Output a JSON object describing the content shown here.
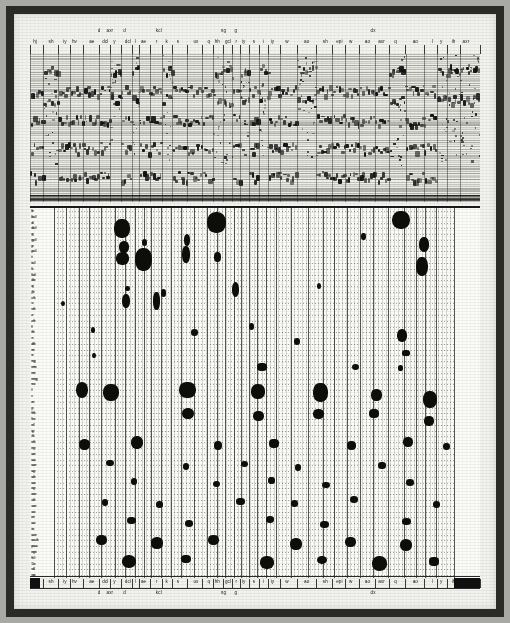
{
  "figure": {
    "type": "speech-spectrogram-with-phonetic-lattice",
    "colors": {
      "paper": "#f2f2ee",
      "ink": "#0d0d0b",
      "frame": "#2a2a28",
      "grid": "#5a5a58"
    }
  },
  "top_labels": {
    "main_row": [
      {
        "text": "hj",
        "x": 1.8
      },
      {
        "text": "sh",
        "x": 7.5
      },
      {
        "text": "iy",
        "x": 12.4
      },
      {
        "text": "hv",
        "x": 15.8
      },
      {
        "text": "ae",
        "x": 22.0
      },
      {
        "text": "dcl",
        "x": 26.8
      },
      {
        "text": "y",
        "x": 30.0
      },
      {
        "text": "dcl",
        "x": 34.8
      },
      {
        "text": "l",
        "x": 37.4
      },
      {
        "text": "ae",
        "x": 40.4
      },
      {
        "text": "r",
        "x": 45.0
      },
      {
        "text": "k",
        "x": 48.6
      },
      {
        "text": "s",
        "x": 52.6
      },
      {
        "text": "ux",
        "x": 59.0
      },
      {
        "text": "q",
        "x": 63.6
      },
      {
        "text": "hh",
        "x": 66.6
      },
      {
        "text": "gcl",
        "x": 70.4
      },
      {
        "text": "r",
        "x": 73.4
      },
      {
        "text": "iy",
        "x": 76.0
      },
      {
        "text": "s",
        "x": 79.6
      },
      {
        "text": "i",
        "x": 83.0
      },
      {
        "text": "iy",
        "x": 86.2
      },
      {
        "text": "w",
        "x": 91.4
      },
      {
        "text": "ao",
        "x": 98.4
      },
      {
        "text": "sh",
        "x": 105.0
      },
      {
        "text": "epi",
        "x": 110.0
      },
      {
        "text": "w",
        "x": 114.0
      },
      {
        "text": "ao",
        "x": 120.0
      },
      {
        "text": "axr",
        "x": 125.0
      },
      {
        "text": "q",
        "x": 130.0
      },
      {
        "text": "ao",
        "x": 137.0
      },
      {
        "text": "l",
        "x": 143.0
      },
      {
        "text": "y",
        "x": 146.2
      },
      {
        "text": "ih",
        "x": 150.6
      },
      {
        "text": "axr",
        "x": 155.0
      }
    ],
    "sub_row": [
      {
        "text": "d",
        "x": 24.6
      },
      {
        "text": "axr",
        "x": 28.4
      },
      {
        "text": "d",
        "x": 33.6
      },
      {
        "text": "kcl",
        "x": 45.8
      },
      {
        "text": "ng",
        "x": 68.8
      },
      {
        "text": "g",
        "x": 73.2
      },
      {
        "text": "dx",
        "x": 122.0
      }
    ]
  },
  "bottom_labels": {
    "main_row": [
      {
        "text": "hj",
        "x": 1.8
      },
      {
        "text": "sh",
        "x": 7.5
      },
      {
        "text": "iy",
        "x": 12.4
      },
      {
        "text": "hv",
        "x": 15.8
      },
      {
        "text": "ae",
        "x": 22.0
      },
      {
        "text": "dcl",
        "x": 26.8
      },
      {
        "text": "y",
        "x": 30.0
      },
      {
        "text": "dcl",
        "x": 34.8
      },
      {
        "text": "l",
        "x": 37.4
      },
      {
        "text": "ae",
        "x": 40.4
      },
      {
        "text": "r",
        "x": 45.0
      },
      {
        "text": "k",
        "x": 48.6
      },
      {
        "text": "s",
        "x": 52.6
      },
      {
        "text": "ux",
        "x": 59.0
      },
      {
        "text": "q",
        "x": 63.6
      },
      {
        "text": "hh",
        "x": 66.6
      },
      {
        "text": "gcl",
        "x": 70.4
      },
      {
        "text": "r",
        "x": 73.4
      },
      {
        "text": "iy",
        "x": 76.0
      },
      {
        "text": "s",
        "x": 79.6
      },
      {
        "text": "i",
        "x": 83.0
      },
      {
        "text": "iy",
        "x": 86.2
      },
      {
        "text": "w",
        "x": 91.4
      },
      {
        "text": "ao",
        "x": 98.4
      },
      {
        "text": "sh",
        "x": 105.0
      },
      {
        "text": "epi",
        "x": 110.0
      },
      {
        "text": "w",
        "x": 114.0
      },
      {
        "text": "ao",
        "x": 120.0
      },
      {
        "text": "axr",
        "x": 125.0
      },
      {
        "text": "q",
        "x": 130.0
      },
      {
        "text": "ao",
        "x": 137.0
      },
      {
        "text": "l",
        "x": 143.0
      },
      {
        "text": "y",
        "x": 146.2
      },
      {
        "text": "ih",
        "x": 150.6
      },
      {
        "text": "axr",
        "x": 155.0
      }
    ],
    "sub_row": [
      {
        "text": "d",
        "x": 24.6
      },
      {
        "text": "axr",
        "x": 28.4
      },
      {
        "text": "d",
        "x": 33.6
      },
      {
        "text": "kcl",
        "x": 45.8
      },
      {
        "text": "ng",
        "x": 68.8
      },
      {
        "text": "g",
        "x": 73.2
      },
      {
        "text": "dx",
        "x": 122.0
      }
    ]
  },
  "axis_labels": {
    "left": [
      "b",
      "bcl",
      "d",
      "dcl",
      "g",
      "gcl",
      "p",
      "pcl",
      "t",
      "tcl",
      "k",
      "kcl",
      "dx",
      "q",
      "jh",
      "ch",
      "s",
      "sh",
      "z",
      "zh",
      "f",
      "th",
      "v",
      "dh",
      "m",
      "n",
      "ng",
      "em",
      "en",
      "eng",
      "nx",
      "l",
      "r",
      "w",
      "y",
      "hh",
      "hv",
      "el",
      "iy",
      "ih",
      "eh",
      "ey",
      "ae",
      "aa",
      "aw",
      "ay",
      "ah",
      "ao",
      "oy",
      "ow",
      "uh",
      "uw",
      "ux",
      "er",
      "ax",
      "ix",
      "axr",
      "ax-h",
      "pau",
      "epi",
      "h#",
      "1x",
      "sil",
      "sp"
    ],
    "right": [
      "b",
      "bcl",
      "d",
      "dcl",
      "g",
      "gcl",
      "p",
      "pcl",
      "t",
      "tcl",
      "k",
      "kcl",
      "dx",
      "q",
      "jh",
      "ch",
      "s",
      "sh",
      "z",
      "zh",
      "f",
      "th",
      "v",
      "dh",
      "m",
      "n",
      "ng",
      "em",
      "en",
      "eng",
      "nx",
      "l",
      "r",
      "w",
      "y",
      "hh",
      "hv",
      "el",
      "iy",
      "ih",
      "eh",
      "ey",
      "ae",
      "aa",
      "aw",
      "ay",
      "ah",
      "ao",
      "oy",
      "ow",
      "uh",
      "uw",
      "ux",
      "er",
      "ax",
      "ix",
      "axr",
      "ax-h",
      "pau",
      "epi",
      "h#",
      "1x",
      "sil",
      "sp"
    ]
  },
  "chart_data": {
    "type": "heatmap",
    "title": "",
    "xlabel": "",
    "ylabel": "",
    "grid": true,
    "legend": "none",
    "blobs": [
      {
        "x": 17.0,
        "y": 3.0,
        "w": 3.4,
        "h": 2.6
      },
      {
        "x": 40.6,
        "y": 2.0,
        "w": 4.2,
        "h": 3.0
      },
      {
        "x": 86.8,
        "y": 1.6,
        "w": 4.0,
        "h": 2.6
      },
      {
        "x": 17.6,
        "y": 6.2,
        "w": 2.2,
        "h": 1.6
      },
      {
        "x": 22.6,
        "y": 5.4,
        "w": 1.2,
        "h": 1.0
      },
      {
        "x": 33.2,
        "y": 5.0,
        "w": 1.4,
        "h": 1.6
      },
      {
        "x": 77.4,
        "y": 4.4,
        "w": 1.0,
        "h": 1.0
      },
      {
        "x": 92.6,
        "y": 5.8,
        "w": 2.2,
        "h": 2.0
      },
      {
        "x": 17.2,
        "y": 8.2,
        "w": 2.8,
        "h": 1.8
      },
      {
        "x": 22.4,
        "y": 8.4,
        "w": 3.6,
        "h": 3.2
      },
      {
        "x": 33.0,
        "y": 7.6,
        "w": 1.6,
        "h": 2.4
      },
      {
        "x": 40.8,
        "y": 8.0,
        "w": 1.6,
        "h": 1.4
      },
      {
        "x": 92.0,
        "y": 9.6,
        "w": 2.6,
        "h": 2.6
      },
      {
        "x": 18.4,
        "y": 13.4,
        "w": 1.0,
        "h": 0.8
      },
      {
        "x": 27.4,
        "y": 14.2,
        "w": 1.2,
        "h": 1.0
      },
      {
        "x": 45.4,
        "y": 13.6,
        "w": 1.6,
        "h": 2.0
      },
      {
        "x": 66.2,
        "y": 13.0,
        "w": 1.0,
        "h": 0.8
      },
      {
        "x": 18.0,
        "y": 15.6,
        "w": 1.6,
        "h": 2.0
      },
      {
        "x": 25.6,
        "y": 15.6,
        "w": 1.4,
        "h": 2.4
      },
      {
        "x": 2.2,
        "y": 16.0,
        "w": 1.0,
        "h": 0.8
      },
      {
        "x": 9.8,
        "y": 20.6,
        "w": 0.8,
        "h": 0.8
      },
      {
        "x": 10.0,
        "y": 25.0,
        "w": 0.8,
        "h": 0.8
      },
      {
        "x": 35.2,
        "y": 21.0,
        "w": 1.6,
        "h": 1.0
      },
      {
        "x": 49.4,
        "y": 20.0,
        "w": 1.2,
        "h": 1.0
      },
      {
        "x": 60.8,
        "y": 22.6,
        "w": 1.4,
        "h": 1.0
      },
      {
        "x": 87.0,
        "y": 21.6,
        "w": 2.2,
        "h": 1.8
      },
      {
        "x": 88.0,
        "y": 24.6,
        "w": 1.6,
        "h": 0.8
      },
      {
        "x": 52.0,
        "y": 27.0,
        "w": 2.0,
        "h": 1.0
      },
      {
        "x": 75.4,
        "y": 27.0,
        "w": 1.6,
        "h": 0.9
      },
      {
        "x": 86.6,
        "y": 27.2,
        "w": 1.2,
        "h": 0.8
      },
      {
        "x": 7.0,
        "y": 31.0,
        "w": 2.8,
        "h": 2.2
      },
      {
        "x": 14.2,
        "y": 31.4,
        "w": 3.4,
        "h": 2.4
      },
      {
        "x": 33.4,
        "y": 31.0,
        "w": 3.6,
        "h": 2.2
      },
      {
        "x": 51.0,
        "y": 31.2,
        "w": 3.0,
        "h": 2.0
      },
      {
        "x": 66.6,
        "y": 31.4,
        "w": 3.2,
        "h": 2.6
      },
      {
        "x": 80.6,
        "y": 31.8,
        "w": 2.4,
        "h": 1.6
      },
      {
        "x": 94.0,
        "y": 32.6,
        "w": 3.0,
        "h": 2.4
      },
      {
        "x": 33.6,
        "y": 35.0,
        "w": 2.6,
        "h": 1.6
      },
      {
        "x": 51.2,
        "y": 35.4,
        "w": 2.4,
        "h": 1.4
      },
      {
        "x": 66.0,
        "y": 35.2,
        "w": 2.4,
        "h": 1.4
      },
      {
        "x": 80.0,
        "y": 35.0,
        "w": 2.0,
        "h": 1.2
      },
      {
        "x": 93.8,
        "y": 36.4,
        "w": 2.2,
        "h": 1.4
      },
      {
        "x": 7.6,
        "y": 40.4,
        "w": 2.4,
        "h": 1.6
      },
      {
        "x": 20.8,
        "y": 40.0,
        "w": 2.6,
        "h": 1.8
      },
      {
        "x": 41.0,
        "y": 40.6,
        "w": 1.8,
        "h": 1.2
      },
      {
        "x": 55.0,
        "y": 40.2,
        "w": 2.0,
        "h": 1.2
      },
      {
        "x": 74.4,
        "y": 40.6,
        "w": 2.0,
        "h": 1.2
      },
      {
        "x": 88.6,
        "y": 40.0,
        "w": 2.2,
        "h": 1.4
      },
      {
        "x": 98.2,
        "y": 40.8,
        "w": 1.6,
        "h": 1.0
      },
      {
        "x": 14.0,
        "y": 43.6,
        "w": 1.6,
        "h": 0.9
      },
      {
        "x": 33.0,
        "y": 44.2,
        "w": 1.4,
        "h": 0.9
      },
      {
        "x": 47.6,
        "y": 43.8,
        "w": 1.6,
        "h": 0.9
      },
      {
        "x": 61.0,
        "y": 44.4,
        "w": 1.4,
        "h": 0.9
      },
      {
        "x": 82.0,
        "y": 44.0,
        "w": 1.6,
        "h": 0.9
      },
      {
        "x": 20.0,
        "y": 46.8,
        "w": 1.4,
        "h": 0.9
      },
      {
        "x": 40.6,
        "y": 47.2,
        "w": 1.6,
        "h": 0.9
      },
      {
        "x": 54.4,
        "y": 46.6,
        "w": 1.4,
        "h": 0.9
      },
      {
        "x": 68.0,
        "y": 47.4,
        "w": 1.6,
        "h": 0.9
      },
      {
        "x": 89.0,
        "y": 47.0,
        "w": 1.8,
        "h": 1.0
      },
      {
        "x": 12.8,
        "y": 50.4,
        "w": 1.4,
        "h": 0.9
      },
      {
        "x": 26.4,
        "y": 50.8,
        "w": 1.6,
        "h": 0.9
      },
      {
        "x": 46.6,
        "y": 50.2,
        "w": 1.8,
        "h": 1.0
      },
      {
        "x": 60.2,
        "y": 50.6,
        "w": 1.6,
        "h": 0.9
      },
      {
        "x": 75.0,
        "y": 50.0,
        "w": 1.8,
        "h": 1.0
      },
      {
        "x": 95.6,
        "y": 50.8,
        "w": 1.6,
        "h": 0.9
      },
      {
        "x": 19.4,
        "y": 53.6,
        "w": 2.0,
        "h": 1.0
      },
      {
        "x": 33.8,
        "y": 54.0,
        "w": 1.8,
        "h": 1.0
      },
      {
        "x": 54.0,
        "y": 53.4,
        "w": 1.8,
        "h": 1.0
      },
      {
        "x": 67.6,
        "y": 54.2,
        "w": 2.0,
        "h": 1.0
      },
      {
        "x": 88.2,
        "y": 53.8,
        "w": 2.0,
        "h": 1.0
      },
      {
        "x": 11.8,
        "y": 57.0,
        "w": 2.4,
        "h": 1.4
      },
      {
        "x": 25.8,
        "y": 57.4,
        "w": 2.6,
        "h": 1.6
      },
      {
        "x": 39.8,
        "y": 57.0,
        "w": 2.4,
        "h": 1.4
      },
      {
        "x": 60.4,
        "y": 57.6,
        "w": 2.6,
        "h": 1.6
      },
      {
        "x": 74.0,
        "y": 57.2,
        "w": 2.4,
        "h": 1.4
      },
      {
        "x": 88.0,
        "y": 57.8,
        "w": 2.8,
        "h": 1.6
      },
      {
        "x": 18.8,
        "y": 60.6,
        "w": 3.2,
        "h": 1.8
      },
      {
        "x": 33.0,
        "y": 60.2,
        "w": 2.0,
        "h": 1.2
      },
      {
        "x": 53.2,
        "y": 60.8,
        "w": 3.0,
        "h": 1.8
      },
      {
        "x": 67.0,
        "y": 60.4,
        "w": 2.2,
        "h": 1.2
      },
      {
        "x": 81.4,
        "y": 61.0,
        "w": 3.4,
        "h": 2.0
      },
      {
        "x": 95.0,
        "y": 60.6,
        "w": 2.0,
        "h": 1.2
      }
    ]
  }
}
